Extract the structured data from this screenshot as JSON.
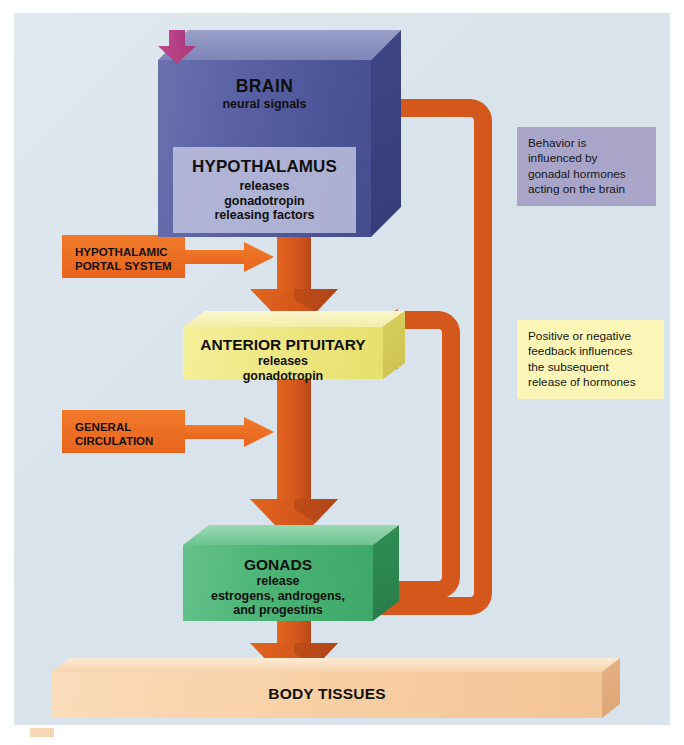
{
  "diagram": {
    "background_color": "#d9e3eb",
    "accent_orange": "#d4571b",
    "boxes": {
      "brain": {
        "title": "BRAIN",
        "subtitle": "neural signals",
        "color": "#5a62a5"
      },
      "hypothalamus": {
        "title": "HYPOTHALAMUS",
        "lines": "releases\ngonadotropin\nreleasing factors",
        "color": "#c5c8e2"
      },
      "pituitary": {
        "title": "ANTERIOR PITUITARY",
        "lines": "releases\ngonadotropin",
        "color": "#eee884"
      },
      "gonads": {
        "title": "GONADS",
        "lines": "release\nestrogens, androgens,\nand progestins",
        "color": "#4db577"
      },
      "tissues": {
        "title": "BODY TISSUES",
        "color": "#f7cfa4"
      }
    },
    "chips": [
      {
        "label": "HYPOTHALAMIC\nPORTAL SYSTEM",
        "color": "#e8641d"
      },
      {
        "label": "GENERAL\nCIRCULATION",
        "color": "#e8641d"
      }
    ],
    "callouts": {
      "behavior": {
        "lines": [
          "Behavior is",
          "influenced by",
          "gonadal hormones",
          "acting on the brain"
        ],
        "color": "#a9a5c8"
      },
      "feedback": {
        "lines": [
          "Positive or negative",
          "feedback influences",
          "the subsequent",
          "release of hormones"
        ],
        "color": "#fbf6b8"
      }
    },
    "flows": [
      {
        "from": "HYPOTHALAMUS",
        "to": "ANTERIOR PITUITARY",
        "direction": "down"
      },
      {
        "from": "ANTERIOR PITUITARY",
        "to": "GONADS",
        "direction": "down"
      },
      {
        "from": "GONADS",
        "to": "BODY TISSUES",
        "direction": "down"
      },
      {
        "from": "GONADS",
        "to": "BRAIN",
        "direction": "feedback-loop"
      },
      {
        "from": "GONADS",
        "to": "ANTERIOR PITUITARY",
        "direction": "feedback-loop"
      },
      {
        "from": "BRAIN",
        "to": "HYPOTHALAMUS",
        "direction": "down",
        "label": "neural signals"
      }
    ]
  }
}
